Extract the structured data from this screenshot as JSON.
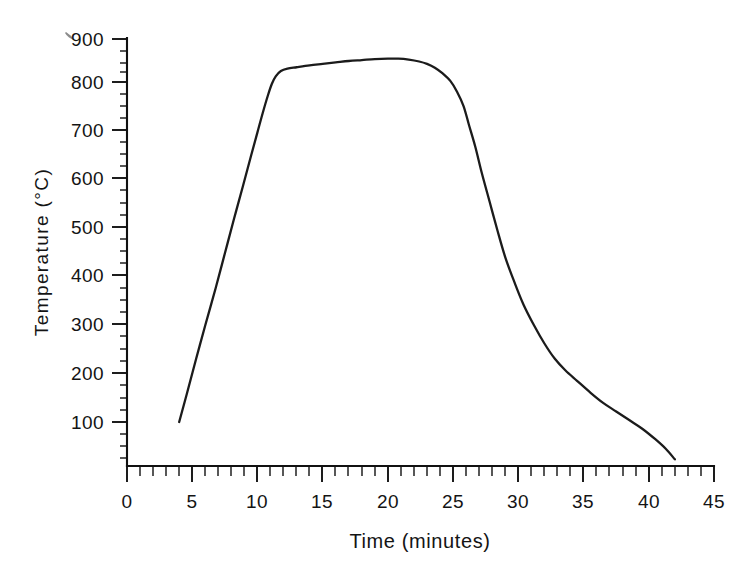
{
  "figure": {
    "background_color": "#ffffff",
    "ink_color": "#1b1b1b",
    "scan_artifact_name": "scan-speck"
  },
  "chart_data": {
    "type": "line",
    "title": "",
    "xlabel": "Time (minutes)",
    "ylabel": "Temperature (°C)",
    "xlim": [
      0,
      45
    ],
    "ylim": [
      0,
      900
    ],
    "grid": false,
    "legend": "none",
    "x_major_ticks": [
      0,
      5,
      10,
      15,
      20,
      25,
      30,
      35,
      40,
      45
    ],
    "x_major_tick_labels": [
      "0",
      "5",
      "10",
      "15",
      "20",
      "25",
      "30",
      "35",
      "40",
      "45"
    ],
    "x_minor_tick_interval": 1,
    "y_major_ticks": [
      100,
      200,
      300,
      400,
      500,
      600,
      700,
      800,
      900
    ],
    "y_major_tick_labels": [
      "100",
      "200",
      "300",
      "400",
      "500",
      "600",
      "700",
      "800",
      "900"
    ],
    "y_minor_tick_interval": 25,
    "series": [
      {
        "name": "Thermal profile",
        "line_color": "#1b1b1b",
        "x": [
          4.0,
          4.6,
          5.3,
          6.0,
          6.8,
          7.5,
          8.2,
          8.9,
          9.5,
          10.0,
          10.4,
          10.8,
          11.1,
          11.4,
          11.8,
          12.3,
          13.0,
          14.0,
          15.0,
          16.0,
          17.0,
          18.0,
          19.0,
          20.0,
          20.8,
          21.6,
          22.4,
          23.0,
          23.6,
          24.2,
          24.8,
          25.3,
          25.8,
          26.2,
          26.7,
          27.2,
          27.8,
          28.4,
          29.0,
          29.7,
          30.4,
          31.2,
          32.0,
          32.8,
          33.6,
          34.5,
          35.5,
          36.5,
          37.5,
          38.5,
          39.5,
          40.5,
          41.3,
          42.0
        ],
        "y": [
          100,
          160,
          232,
          302,
          380,
          452,
          524,
          594,
          655,
          705,
          745,
          782,
          806,
          822,
          833,
          838,
          841,
          845,
          848,
          851,
          854,
          856,
          858,
          859,
          859,
          857,
          853,
          848,
          840,
          828,
          812,
          790,
          760,
          722,
          675,
          620,
          560,
          500,
          444,
          392,
          345,
          302,
          264,
          232,
          208,
          186,
          162,
          140,
          122,
          104,
          86,
          64,
          44,
          22
        ]
      }
    ],
    "annotations": [],
    "readings": {
      "start_point": {
        "x": 4,
        "y": 100
      },
      "plateau_start": {
        "x": 11.5,
        "y": 835
      },
      "plateau_peak": {
        "x": 20,
        "y": 859
      },
      "plateau_end": {
        "x": 25,
        "y": 845
      },
      "end_point": {
        "x": 42,
        "y": 20
      }
    }
  }
}
